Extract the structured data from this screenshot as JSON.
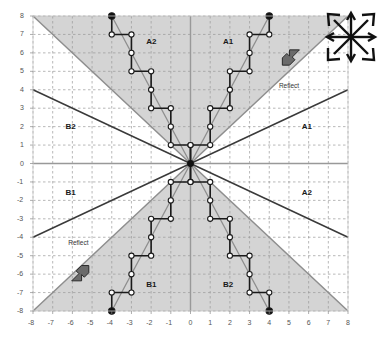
{
  "figure": {
    "title": "",
    "axes": {
      "x_label": "",
      "y_label": "",
      "x_min": -8,
      "x_max": 8,
      "y_min": -8,
      "y_max": 8,
      "x_ticks": [
        "-8",
        "-7",
        "-6",
        "-5",
        "-4",
        "-3",
        "-2",
        "-1",
        "0",
        "1",
        "2",
        "3",
        "4",
        "5",
        "6",
        "7",
        "8"
      ],
      "y_ticks": [
        "8",
        "7",
        "6",
        "5",
        "4",
        "3",
        "2",
        "1",
        "0",
        "-1",
        "-2",
        "-3",
        "-4",
        "-5",
        "-6",
        "-7",
        "-8"
      ],
      "grid": true
    },
    "colors": {
      "shaded_region": "#d4d4d4",
      "grid": "#9a9a9a",
      "axis": "#999999",
      "dark_line": "#3a3a3a",
      "gray_line": "#8e8e8e",
      "marker_fill": "#ffffff",
      "marker_stroke": "#1a1a1a",
      "endpoint": "#111111",
      "arrow_fill": "#6b6b6b",
      "arrow_stroke": "#2a2a2a",
      "background": "#ffffff"
    },
    "region_labels": [
      {
        "text": "A2",
        "x": -2.0,
        "y": 6.6
      },
      {
        "text": "A1",
        "x": 1.9,
        "y": 6.6
      },
      {
        "text": "B2",
        "x": -6.1,
        "y": 2.0
      },
      {
        "text": "A1",
        "x": 5.9,
        "y": 2.0
      },
      {
        "text": "B1",
        "x": -6.1,
        "y": -1.6
      },
      {
        "text": "A2",
        "x": 5.9,
        "y": -1.6
      },
      {
        "text": "B1",
        "x": -2.0,
        "y": -6.6
      },
      {
        "text": "B2",
        "x": 1.9,
        "y": -6.6
      }
    ],
    "annotations": [
      {
        "text": "Reflect",
        "x": 5.1,
        "y": 4.15,
        "arrow_direction": "up-right",
        "arrow_x": 5.1,
        "arrow_y": 5.7
      },
      {
        "text": "Reflect",
        "x": -5.6,
        "y": -4.35,
        "arrow_direction": "down-left",
        "arrow_x": -5.6,
        "arrow_y": -5.9
      }
    ],
    "boundary_lines": [
      {
        "name": "gray-diagonal-up-right",
        "from": [
          0,
          0
        ],
        "to": [
          8,
          8
        ],
        "style": "gray"
      },
      {
        "name": "gray-diagonal-up-left",
        "from": [
          0,
          0
        ],
        "to": [
          -8,
          8
        ],
        "style": "gray"
      },
      {
        "name": "gray-diagonal-down-right",
        "from": [
          0,
          0
        ],
        "to": [
          8,
          -8
        ],
        "style": "gray"
      },
      {
        "name": "gray-diagonal-down-left",
        "from": [
          0,
          0
        ],
        "to": [
          -8,
          -8
        ],
        "style": "gray"
      },
      {
        "name": "dark-halfslope-up-right",
        "from": [
          0,
          0
        ],
        "to": [
          8,
          4
        ],
        "style": "dark"
      },
      {
        "name": "dark-halfslope-up-left",
        "from": [
          0,
          0
        ],
        "to": [
          -8,
          4
        ],
        "style": "dark"
      },
      {
        "name": "dark-halfslope-down-right",
        "from": [
          0,
          0
        ],
        "to": [
          8,
          -4
        ],
        "style": "dark"
      },
      {
        "name": "dark-halfslope-down-left",
        "from": [
          0,
          0
        ],
        "to": [
          -8,
          -4
        ],
        "style": "dark"
      }
    ],
    "shaded_polygons": [
      {
        "name": "upper-wedge",
        "points": [
          [
            0,
            0
          ],
          [
            -8,
            8
          ],
          [
            8,
            8
          ]
        ]
      },
      {
        "name": "lower-wedge",
        "points": [
          [
            0,
            0
          ],
          [
            -8,
            -8
          ],
          [
            8,
            -8
          ]
        ]
      }
    ],
    "ideal_lines": [
      {
        "name": "ideal-line-q1",
        "from": [
          0,
          0
        ],
        "to": [
          4,
          8
        ]
      },
      {
        "name": "ideal-line-q2",
        "from": [
          0,
          0
        ],
        "to": [
          -4,
          8
        ]
      },
      {
        "name": "ideal-line-q3",
        "from": [
          0,
          0
        ],
        "to": [
          -4,
          -8
        ]
      },
      {
        "name": "ideal-line-q4",
        "from": [
          0,
          0
        ],
        "to": [
          4,
          -8
        ]
      }
    ],
    "staircase_paths": [
      {
        "name": "staircase-q1",
        "points": [
          [
            0,
            0
          ],
          [
            0,
            1
          ],
          [
            1,
            1
          ],
          [
            1,
            2
          ],
          [
            1,
            3
          ],
          [
            2,
            3
          ],
          [
            2,
            4
          ],
          [
            2,
            5
          ],
          [
            3,
            5
          ],
          [
            3,
            6
          ],
          [
            3,
            7
          ],
          [
            4,
            7
          ],
          [
            4,
            8
          ]
        ],
        "endpoint": [
          4,
          8
        ]
      },
      {
        "name": "staircase-q2",
        "points": [
          [
            0,
            0
          ],
          [
            0,
            1
          ],
          [
            -1,
            1
          ],
          [
            -1,
            2
          ],
          [
            -1,
            3
          ],
          [
            -2,
            3
          ],
          [
            -2,
            4
          ],
          [
            -2,
            5
          ],
          [
            -3,
            5
          ],
          [
            -3,
            6
          ],
          [
            -3,
            7
          ],
          [
            -4,
            7
          ],
          [
            -4,
            8
          ]
        ],
        "endpoint": [
          -4,
          8
        ]
      },
      {
        "name": "staircase-q3",
        "points": [
          [
            0,
            0
          ],
          [
            0,
            -1
          ],
          [
            -1,
            -1
          ],
          [
            -1,
            -2
          ],
          [
            -1,
            -3
          ],
          [
            -2,
            -3
          ],
          [
            -2,
            -4
          ],
          [
            -2,
            -5
          ],
          [
            -3,
            -5
          ],
          [
            -3,
            -6
          ],
          [
            -3,
            -7
          ],
          [
            -4,
            -7
          ],
          [
            -4,
            -8
          ]
        ],
        "endpoint": [
          -4,
          -8
        ]
      },
      {
        "name": "staircase-q4",
        "points": [
          [
            0,
            0
          ],
          [
            0,
            -1
          ],
          [
            1,
            -1
          ],
          [
            1,
            -2
          ],
          [
            1,
            -3
          ],
          [
            2,
            -3
          ],
          [
            2,
            -4
          ],
          [
            2,
            -5
          ],
          [
            3,
            -5
          ],
          [
            3,
            -6
          ],
          [
            3,
            -7
          ],
          [
            4,
            -7
          ],
          [
            4,
            -8
          ]
        ],
        "endpoint": [
          4,
          -8
        ]
      }
    ],
    "origin_marker": [
      0,
      0
    ]
  },
  "compass_icon": {
    "name": "eight-direction-arrows-icon",
    "directions": [
      "up",
      "up-right",
      "right",
      "down-right",
      "down",
      "down-left",
      "left",
      "up-left"
    ]
  }
}
